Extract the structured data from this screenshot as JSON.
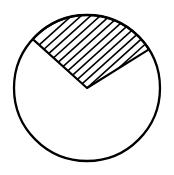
{
  "figure": {
    "title": "Circle with shaded hatched sector",
    "background_color": "#ffffff",
    "stroke_color": "#000000",
    "hatch_color": "#000000",
    "fill_color": "none"
  },
  "canvas": {
    "width": 174,
    "height": 175
  },
  "chart_data": {
    "type": "diagram",
    "shapes": [
      {
        "name": "circle-outline",
        "kind": "circle",
        "cx": 87,
        "cy": 88,
        "r": 73,
        "stroke": "#000000",
        "stroke_width": 2.3,
        "fill": "none"
      },
      {
        "name": "hatched-sector",
        "kind": "sector",
        "apex_x": 87,
        "apex_y": 88,
        "radius": 73,
        "start_angle_deg": 32,
        "end_angle_deg": 138,
        "sweep_deg": 106,
        "stroke": "#000000",
        "stroke_width": 2.1,
        "fill": "hatch"
      }
    ],
    "hatch": {
      "angle_deg": 42,
      "spacing_px": 6.4,
      "line_width": 1.6,
      "line_count": 19,
      "color": "#000000"
    },
    "vertices": {
      "center": [
        87,
        88
      ],
      "left_arc_point": [
        33,
        41
      ],
      "right_arc_point": [
        149,
        51
      ],
      "top_of_circle": [
        87,
        15
      ],
      "bottom_of_circle": [
        87,
        161
      ]
    },
    "title": "",
    "xlabel": "",
    "ylabel": "",
    "legend": [],
    "annotations": []
  }
}
